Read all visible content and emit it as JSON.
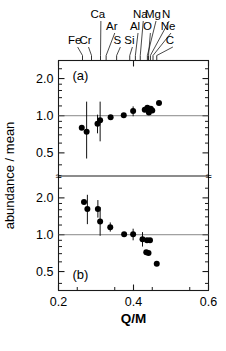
{
  "figure": {
    "title": "",
    "xlabel": "Q/M",
    "ylabel": "abundance / mean",
    "panel_a_label": "(a)",
    "panel_b_label": "(b)",
    "axis_break_symbol": "≈"
  },
  "chart_data": {
    "type": "scatter",
    "title": "",
    "xlabel": "Q/M",
    "ylabel": "abundance / mean",
    "xlim": [
      0.2,
      0.6
    ],
    "xticks": [
      0.2,
      0.4,
      0.6
    ],
    "xticklabels": [
      "0.2",
      "0.4",
      "0.6"
    ],
    "grid": false,
    "legend": "none",
    "yscale": "log",
    "panels": [
      {
        "name": "(a)",
        "ylim": [
          0.35,
          2.8
        ],
        "yticks": [
          0.5,
          1.0,
          2.0
        ],
        "yticklabels": [
          "0.5",
          "1.0",
          "2.0"
        ],
        "reference_line_y": 1.0,
        "points": [
          {
            "x": 0.262,
            "y": 0.8,
            "yerr_low": 0.8,
            "yerr_high": 0.8
          },
          {
            "x": 0.275,
            "y": 0.74,
            "yerr_low": 0.45,
            "yerr_high": 1.3
          },
          {
            "x": 0.304,
            "y": 0.86,
            "yerr_low": 0.72,
            "yerr_high": 1.02
          },
          {
            "x": 0.311,
            "y": 0.92,
            "yerr_low": 0.62,
            "yerr_high": 1.3
          },
          {
            "x": 0.339,
            "y": 0.97,
            "yerr_low": 0.97,
            "yerr_high": 0.97
          },
          {
            "x": 0.374,
            "y": 1.01,
            "yerr_low": 1.01,
            "yerr_high": 1.01
          },
          {
            "x": 0.399,
            "y": 1.09,
            "yerr_low": 0.99,
            "yerr_high": 1.19
          },
          {
            "x": 0.43,
            "y": 1.12,
            "yerr_low": 1.12,
            "yerr_high": 1.12
          },
          {
            "x": 0.437,
            "y": 1.16,
            "yerr_low": 1.16,
            "yerr_high": 1.16
          },
          {
            "x": 0.441,
            "y": 1.06,
            "yerr_low": 1.06,
            "yerr_high": 1.06
          },
          {
            "x": 0.446,
            "y": 1.14,
            "yerr_low": 1.14,
            "yerr_high": 1.14
          },
          {
            "x": 0.45,
            "y": 1.1,
            "yerr_low": 1.1,
            "yerr_high": 1.1
          },
          {
            "x": 0.468,
            "y": 1.27,
            "yerr_low": 1.27,
            "yerr_high": 1.27
          }
        ]
      },
      {
        "name": "(b)",
        "ylim": [
          0.35,
          2.8
        ],
        "yticks": [
          0.5,
          1.0,
          2.0
        ],
        "yticklabels": [
          "0.5",
          "1.0",
          "2.0"
        ],
        "reference_line_y": 1.0,
        "points": [
          {
            "x": 0.268,
            "y": 1.85,
            "yerr_low": 1.85,
            "yerr_high": 1.85
          },
          {
            "x": 0.277,
            "y": 1.62,
            "yerr_low": 1.22,
            "yerr_high": 2.12
          },
          {
            "x": 0.305,
            "y": 1.62,
            "yerr_low": 1.38,
            "yerr_high": 1.92
          },
          {
            "x": 0.311,
            "y": 1.28,
            "yerr_low": 0.98,
            "yerr_high": 1.68
          },
          {
            "x": 0.338,
            "y": 1.15,
            "yerr_low": 1.06,
            "yerr_high": 1.26
          },
          {
            "x": 0.375,
            "y": 1.01,
            "yerr_low": 1.01,
            "yerr_high": 1.01
          },
          {
            "x": 0.399,
            "y": 1.01,
            "yerr_low": 0.9,
            "yerr_high": 1.12
          },
          {
            "x": 0.424,
            "y": 0.92,
            "yerr_low": 0.8,
            "yerr_high": 1.05
          },
          {
            "x": 0.436,
            "y": 0.9,
            "yerr_low": 0.9,
            "yerr_high": 0.9
          },
          {
            "x": 0.444,
            "y": 0.9,
            "yerr_low": 0.9,
            "yerr_high": 0.9
          },
          {
            "x": 0.434,
            "y": 0.72,
            "yerr_low": 0.72,
            "yerr_high": 0.72
          },
          {
            "x": 0.44,
            "y": 0.71,
            "yerr_low": 0.71,
            "yerr_high": 0.71
          },
          {
            "x": 0.462,
            "y": 0.58,
            "yerr_low": 0.58,
            "yerr_high": 0.58
          }
        ]
      }
    ],
    "element_markers": [
      {
        "label": "Fe",
        "x": 0.264,
        "label_x": 0.243,
        "label_row": 2
      },
      {
        "label": "Cr",
        "x": 0.288,
        "label_x": 0.272,
        "label_row": 2
      },
      {
        "label": "Ca",
        "x": 0.312,
        "label_x": 0.305,
        "label_row": 0
      },
      {
        "label": "Ar",
        "x": 0.327,
        "label_x": 0.342,
        "label_row": 1
      },
      {
        "label": "S",
        "x": 0.355,
        "label_x": 0.357,
        "label_row": 2
      },
      {
        "label": "Si",
        "x": 0.39,
        "label_x": 0.389,
        "label_row": 2
      },
      {
        "label": "Al",
        "x": 0.405,
        "label_x": 0.404,
        "label_row": 1
      },
      {
        "label": "Na",
        "x": 0.418,
        "label_x": 0.418,
        "label_row": 0
      },
      {
        "label": "Mg",
        "x": 0.437,
        "label_x": 0.452,
        "label_row": 0
      },
      {
        "label": "O",
        "x": 0.44,
        "label_x": 0.437,
        "label_row": 1
      },
      {
        "label": "N",
        "x": 0.445,
        "label_x": 0.487,
        "label_row": 0
      },
      {
        "label": "Ne",
        "x": 0.452,
        "label_x": 0.492,
        "label_row": 1
      },
      {
        "label": "C",
        "x": 0.462,
        "label_x": 0.497,
        "label_row": 2
      }
    ]
  }
}
